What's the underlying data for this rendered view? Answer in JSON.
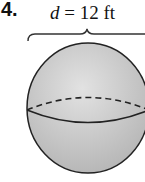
{
  "problem": {
    "number": "4.",
    "label_var": "d",
    "label_rest": " = 12 ft"
  },
  "figure": {
    "shape": "sphere",
    "dimension": "diameter",
    "value": 12,
    "unit": "ft",
    "colors": {
      "fill": "#c8c8c8",
      "stroke": "#222222"
    }
  }
}
